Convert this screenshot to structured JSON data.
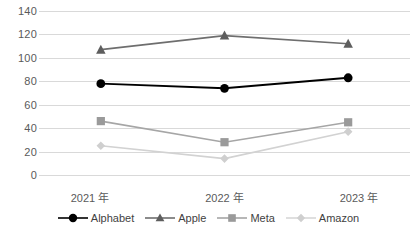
{
  "chart_data": {
    "type": "line",
    "title": "",
    "xlabel": "",
    "ylabel": "",
    "categories": [
      "2021 年",
      "2022 年",
      "2023 年"
    ],
    "ylim": [
      0,
      140
    ],
    "ytick_labels": [
      "140",
      "120",
      "100",
      "80",
      "60",
      "40",
      "20",
      "0"
    ],
    "ytick_values": [
      140,
      120,
      100,
      80,
      60,
      40,
      20,
      0
    ],
    "grid": true,
    "legend_position": "bottom",
    "series": [
      {
        "name": "Alphabet",
        "values": [
          78,
          74,
          83
        ],
        "color": "#000000",
        "marker": "circle"
      },
      {
        "name": "Apple",
        "values": [
          107,
          119,
          112
        ],
        "color": "#6e6e6e",
        "marker": "triangle"
      },
      {
        "name": "Meta",
        "values": [
          46,
          28,
          45
        ],
        "color": "#a6a6a6",
        "marker": "square"
      },
      {
        "name": "Amazon",
        "values": [
          25,
          14,
          37
        ],
        "color": "#d2d2d2",
        "marker": "diamond"
      }
    ]
  },
  "legend": {
    "items": [
      {
        "label": "Alphabet"
      },
      {
        "label": "Apple"
      },
      {
        "label": "Meta"
      },
      {
        "label": "Amazon"
      }
    ]
  }
}
